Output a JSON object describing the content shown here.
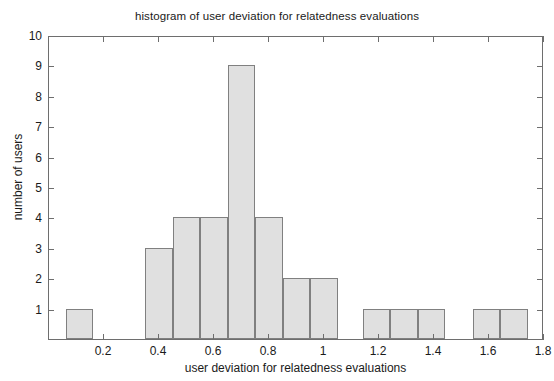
{
  "chart_data": {
    "type": "bar",
    "title": "histogram of user deviation for relatedness evaluations",
    "xlabel": "user deviation for relatedness evaluations",
    "ylabel": "number of users",
    "xlim": [
      0.0,
      1.8
    ],
    "ylim": [
      0,
      10
    ],
    "xticks": [
      0.2,
      0.4,
      0.6,
      0.8,
      1.0,
      1.2,
      1.4,
      1.6,
      1.8
    ],
    "xtick_labels": [
      "0.2",
      "0.4",
      "0.6",
      "0.8",
      "1",
      "1.2",
      "1.4",
      "1.6",
      "1.8"
    ],
    "yticks": [
      1,
      2,
      3,
      4,
      5,
      6,
      7,
      8,
      9,
      10
    ],
    "ytick_labels": [
      "1",
      "2",
      "3",
      "4",
      "5",
      "6",
      "7",
      "8",
      "9",
      "10"
    ],
    "grid": false,
    "legend": null,
    "bin_width": 0.1,
    "bar_fill_color": "#e0e0e0",
    "bar_edge_color": "#808080",
    "axis_color": "#6e6e6e",
    "background_color": "#ffffff",
    "bins": [
      {
        "left": 0.06,
        "right": 0.16,
        "center": 0.11,
        "value": 1
      },
      {
        "left": 0.35,
        "right": 0.45,
        "center": 0.4,
        "value": 3
      },
      {
        "left": 0.45,
        "right": 0.55,
        "center": 0.5,
        "value": 4
      },
      {
        "left": 0.55,
        "right": 0.65,
        "center": 0.6,
        "value": 4
      },
      {
        "left": 0.65,
        "right": 0.75,
        "center": 0.7,
        "value": 9
      },
      {
        "left": 0.75,
        "right": 0.85,
        "center": 0.8,
        "value": 4
      },
      {
        "left": 0.85,
        "right": 0.95,
        "center": 0.9,
        "value": 2
      },
      {
        "left": 0.95,
        "right": 1.05,
        "center": 1.0,
        "value": 2
      },
      {
        "left": 1.14,
        "right": 1.24,
        "center": 1.19,
        "value": 1
      },
      {
        "left": 1.24,
        "right": 1.34,
        "center": 1.29,
        "value": 1
      },
      {
        "left": 1.34,
        "right": 1.44,
        "center": 1.39,
        "value": 1
      },
      {
        "left": 1.54,
        "right": 1.64,
        "center": 1.59,
        "value": 1
      },
      {
        "left": 1.64,
        "right": 1.74,
        "center": 1.69,
        "value": 1
      }
    ],
    "categories": [
      "0.11",
      "0.40",
      "0.50",
      "0.60",
      "0.70",
      "0.80",
      "0.90",
      "1.00",
      "1.19",
      "1.29",
      "1.39",
      "1.59",
      "1.69"
    ],
    "values": [
      1,
      3,
      4,
      4,
      9,
      4,
      2,
      2,
      1,
      1,
      1,
      1,
      1
    ]
  }
}
